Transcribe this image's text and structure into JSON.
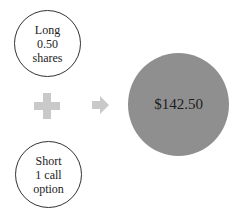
{
  "diagram": {
    "top_node": {
      "lines": [
        "Long",
        "0.50",
        "shares"
      ]
    },
    "bottom_node": {
      "lines": [
        "Short",
        "1 call",
        "option"
      ]
    },
    "operator": "plus-icon",
    "result_arrow": "arrow-right-icon",
    "result_node": {
      "label": "$142.50"
    },
    "colors": {
      "result_fill": "#8f8f8f",
      "operator_fill": "#c9c9c9",
      "node_border": "#333333"
    }
  }
}
